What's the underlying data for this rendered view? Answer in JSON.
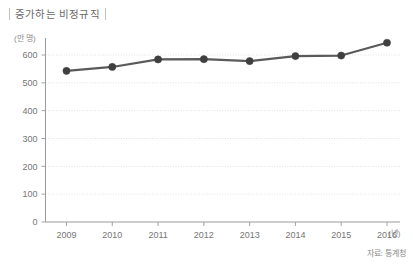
{
  "chart_data": {
    "type": "line",
    "title": "증가하는 비정규직",
    "xlabel": "(년)",
    "ylabel": "(만 명)",
    "categories": [
      "2009",
      "2010",
      "2011",
      "2012",
      "2013",
      "2014",
      "2015",
      "2016"
    ],
    "values": [
      543,
      557,
      584,
      585,
      578,
      596,
      598,
      644
    ],
    "yticks": [
      0,
      100,
      200,
      300,
      400,
      500,
      600
    ],
    "ylim": [
      0,
      700
    ],
    "grid": true,
    "legend": false,
    "source": "자료: 통계청",
    "series_color": "#5a5a5a",
    "marker_color": "#3f3f3f",
    "grid_color": "#d9d9d9",
    "axis_color": "#9a9a9a"
  },
  "header": {
    "title": "증가하는 비정규직"
  },
  "axes": {
    "y_unit": "(만 명)",
    "x_unit": "(년)"
  },
  "footer": {
    "source": "자료: 통계청"
  }
}
